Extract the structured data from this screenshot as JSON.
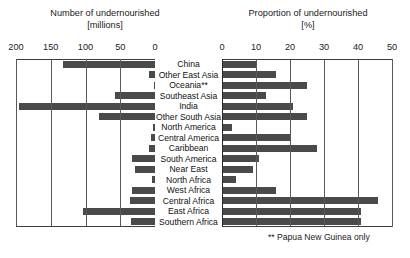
{
  "chart_data": {
    "type": "bar",
    "orientation": "horizontal",
    "title": "",
    "footnote": "** Papua New Guinea only",
    "categories": [
      "China",
      "Other East Asia",
      "Oceania**",
      "Southeast Asia",
      "India",
      "Other South Asia",
      "North America",
      "Central America",
      "Caribbean",
      "South America",
      "Near East",
      "North Africa",
      "West Africa",
      "Central Africa",
      "East Africa",
      "Southern Africa"
    ],
    "panels": [
      {
        "id": "left",
        "title": "Number of undernourished",
        "unit": "[millions]",
        "xlabel": "",
        "ylabel": "",
        "axis_direction": "reversed",
        "xlim": [
          200,
          0
        ],
        "ticks": [
          200,
          150,
          100,
          50,
          0
        ],
        "tick_labels": [
          "200",
          "150",
          "100",
          "50",
          "0"
        ],
        "grid": true,
        "values": [
          132,
          8,
          1,
          58,
          196,
          80,
          3,
          6,
          9,
          33,
          29,
          5,
          33,
          36,
          103,
          34
        ]
      },
      {
        "id": "right",
        "title": "Proportion of undernourished",
        "unit": "[%]",
        "xlabel": "",
        "ylabel": "",
        "axis_direction": "normal",
        "xlim": [
          0,
          50
        ],
        "ticks": [
          0,
          10,
          20,
          30,
          40,
          50
        ],
        "tick_labels": [
          "0",
          "10",
          "20",
          "30",
          "40",
          "50"
        ],
        "grid": true,
        "values": [
          10,
          16,
          25,
          13,
          21,
          25,
          3,
          20,
          28,
          11,
          9,
          4,
          16,
          46,
          41,
          41
        ]
      }
    ],
    "colors": {
      "bar": "#4a4a4a",
      "grid": "#5a5a5a",
      "frame": "#3c3c3c",
      "text": "#1b1b1b",
      "background": "#ffffff"
    }
  }
}
